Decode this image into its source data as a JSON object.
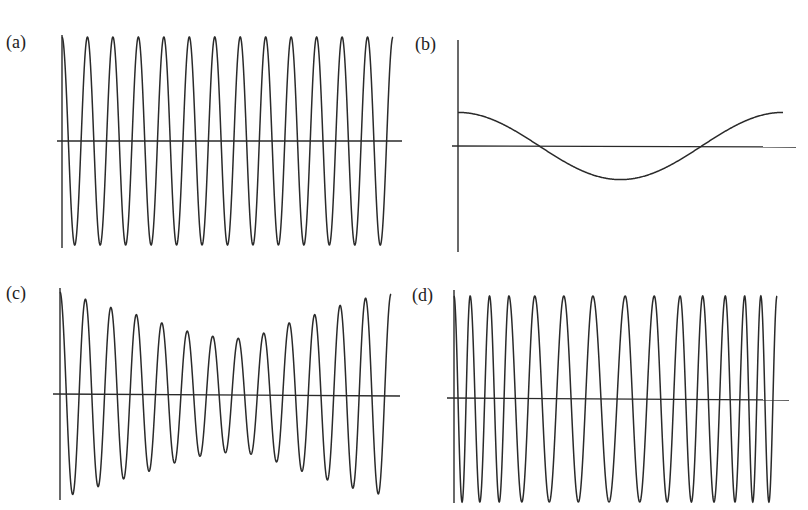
{
  "page": {
    "header_fragment": ""
  },
  "panels": [
    {
      "id": "a",
      "label": "(a)",
      "description": "constant amplitude, constant frequency cosine"
    },
    {
      "id": "b",
      "label": "(b)",
      "description": "single low-frequency cosine cycle, small amplitude"
    },
    {
      "id": "c",
      "label": "(c)",
      "description": "constant frequency, amplitude decreasing then increasing"
    },
    {
      "id": "d",
      "label": "(d)",
      "description": "constant amplitude, frequency decreasing then increasing"
    }
  ],
  "chart_data": [
    {
      "type": "line",
      "panel": "(a)",
      "title": "",
      "xlabel": "",
      "ylabel": "",
      "function": "A*cos(2*pi*t/T)",
      "amplitude": 1.0,
      "cycles": 13,
      "ylim": [
        -1,
        1
      ],
      "grid": false,
      "legend": null
    },
    {
      "type": "line",
      "panel": "(b)",
      "title": "",
      "xlabel": "",
      "ylabel": "",
      "function": "A*cos(2*pi*t/T)",
      "amplitude": 0.32,
      "cycles": 1,
      "ylim": [
        -1,
        1
      ],
      "grid": false,
      "legend": null,
      "zero_crossings_fraction": [
        0.25,
        0.75
      ]
    },
    {
      "type": "line",
      "panel": "(c)",
      "title": "",
      "xlabel": "",
      "ylabel": "",
      "function": "A(t)*cos(2*pi*t/T)",
      "cycles": 13,
      "peak_amplitudes": [
        1.0,
        0.93,
        0.85,
        0.78,
        0.7,
        0.62,
        0.57,
        0.55,
        0.6,
        0.7,
        0.78,
        0.87,
        0.94,
        0.98
      ],
      "ylim": [
        -1,
        1
      ],
      "grid": false,
      "legend": null
    },
    {
      "type": "line",
      "panel": "(d)",
      "title": "",
      "xlabel": "",
      "ylabel": "",
      "function": "cos(phi(t)), chirp slow in middle",
      "amplitude": 1.0,
      "cycles": 14,
      "peak_x_fraction": [
        0.0,
        0.05,
        0.11,
        0.17,
        0.25,
        0.34,
        0.43,
        0.53,
        0.62,
        0.7,
        0.77,
        0.84,
        0.9,
        0.95,
        1.0
      ],
      "ylim": [
        -1,
        1
      ],
      "grid": false,
      "legend": null
    }
  ]
}
